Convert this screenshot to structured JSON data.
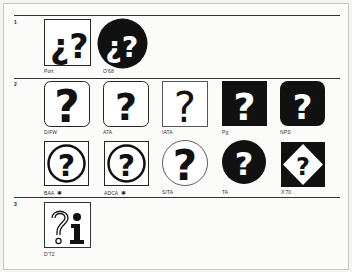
{
  "sections": [
    {
      "number": "1"
    },
    {
      "number": "2"
    },
    {
      "number": "3"
    }
  ],
  "symbols": {
    "port": {
      "label": "Port",
      "icon": "inverted-and-question-mark-square"
    },
    "o68": {
      "label": "O'68",
      "icon": "inverted-and-question-mark-circle-black"
    },
    "dfw": {
      "label": "D/FW",
      "icon": "question-mark-rounded-square"
    },
    "ata": {
      "label": "ATA",
      "icon": "question-mark-rounded-square"
    },
    "iata": {
      "label": "IATA",
      "icon": "thin-question-mark-square"
    },
    "pg": {
      "label": "Pg",
      "icon": "question-mark-black-square"
    },
    "nps": {
      "label": "NPS",
      "icon": "question-mark-black-rounded-square"
    },
    "baa": {
      "label": "BAA",
      "marker": "✱",
      "icon": "question-mark-circle-in-square"
    },
    "adca": {
      "label": "ADCA",
      "marker": "✱",
      "icon": "question-mark-circle-in-square"
    },
    "sta": {
      "label": "S/TA",
      "icon": "question-mark-outline-circle"
    },
    "ta": {
      "label": "TA",
      "icon": "question-mark-black-circle"
    },
    "x70": {
      "label": "X'70",
      "icon": "question-mark-diamond-in-black-square"
    },
    "d72": {
      "label": "D'72",
      "icon": "question-mark-and-info-i-square"
    }
  },
  "colors": {
    "ink": "#111111",
    "paper": "#fbfbfa",
    "frame": "#c8c8c6"
  }
}
